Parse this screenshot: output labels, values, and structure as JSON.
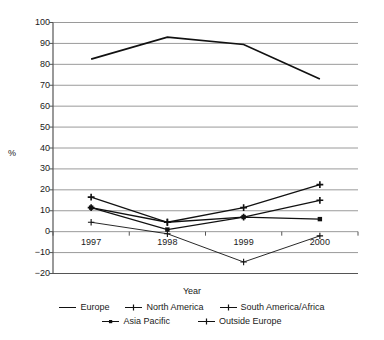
{
  "chart_data": {
    "type": "line",
    "title": "",
    "xlabel": "Year",
    "ylabel": "%",
    "categories": [
      "1997",
      "1998",
      "1999",
      "2000"
    ],
    "ylim": [
      -20,
      100
    ],
    "yticks": [
      -20,
      -10,
      0,
      10,
      20,
      30,
      40,
      50,
      60,
      70,
      80,
      90,
      100
    ],
    "grid": true,
    "legend_position": "bottom",
    "series": [
      {
        "name": "Europe",
        "marker": "none",
        "values": [
          82.5,
          93,
          89.5,
          73
        ]
      },
      {
        "name": "North America",
        "marker": "plus",
        "values": [
          16.5,
          4.5,
          11.5,
          22.5
        ]
      },
      {
        "name": "South America/Africa",
        "marker": "plus",
        "values": [
          11.5,
          4.5,
          7,
          15
        ]
      },
      {
        "name": "Asia Pacific",
        "marker": "square",
        "values": [
          11.5,
          1,
          7,
          6
        ]
      },
      {
        "name": "Outside Europe",
        "marker": "cross",
        "values": [
          4.5,
          -1,
          -14.5,
          -2
        ]
      }
    ]
  },
  "axis": {
    "y_label": "%",
    "x_label": "Year"
  },
  "legend": {
    "row1": [
      "Europe",
      "North America",
      "South America/Africa"
    ],
    "row2": [
      "Asia Pacific",
      "Outside Europe"
    ]
  },
  "colors": {
    "line": "#111111",
    "grid": "#9a9a9a",
    "axis": "#555555",
    "background": "#ffffff"
  }
}
